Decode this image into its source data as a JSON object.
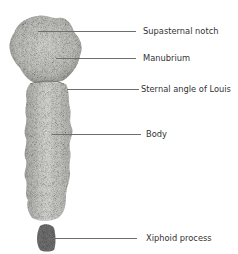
{
  "figure": {
    "labels": [
      {
        "text": "Supasternal notch",
        "y": 31
      },
      {
        "text": "Manubrium",
        "y": 58
      },
      {
        "text": "Sternal angle of Louis",
        "y": 89
      },
      {
        "text": "Body",
        "y": 134
      },
      {
        "text": "Xiphoid process",
        "y": 238
      }
    ]
  }
}
